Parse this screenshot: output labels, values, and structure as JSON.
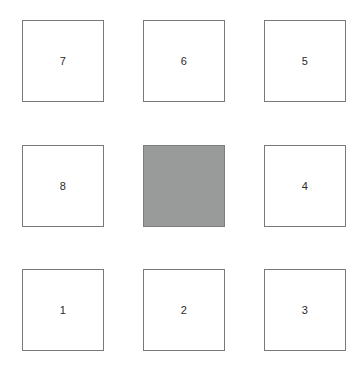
{
  "board": {
    "title": "Sliding Tile Puzzle",
    "rows": 3,
    "columns": 3,
    "background_color": "#ffffff",
    "tile_fill_color": "#ffffff",
    "tile_border_color": "#78797b",
    "blank_fill_color": "#999a9a",
    "blank_border_color": "#7c7d7d",
    "label_color": "#2b2b2b",
    "tiles": [
      {
        "label": "7",
        "blank": false,
        "row": 0,
        "col": 0
      },
      {
        "label": "6",
        "blank": false,
        "row": 0,
        "col": 1
      },
      {
        "label": "5",
        "blank": false,
        "row": 0,
        "col": 2
      },
      {
        "label": "8",
        "blank": false,
        "row": 1,
        "col": 0
      },
      {
        "label": "",
        "blank": true,
        "row": 1,
        "col": 1
      },
      {
        "label": "4",
        "blank": false,
        "row": 1,
        "col": 2
      },
      {
        "label": "1",
        "blank": false,
        "row": 2,
        "col": 0
      },
      {
        "label": "2",
        "blank": false,
        "row": 2,
        "col": 1
      },
      {
        "label": "3",
        "blank": false,
        "row": 2,
        "col": 2
      }
    ]
  }
}
